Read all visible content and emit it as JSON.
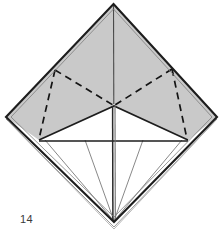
{
  "figure": {
    "step_number": "14",
    "caption_partial": "",
    "background_color": "#ffffff"
  },
  "colors": {
    "paper_shaded": "#c9c9c9",
    "paper_shaded_dark": "#bdbdbd",
    "paper_white": "#ffffff",
    "outline": "#1d1d1d",
    "crease_thin": "#6a6a6a",
    "fold_dashed": "#141414",
    "label_text": "#3a3a3a",
    "edge_layer": "#8a8a8a"
  },
  "geometry": {
    "top_apex": {
      "x": 113.5,
      "y": 4
    },
    "left_vertex": {
      "x": 6,
      "y": 117
    },
    "right_vertex": {
      "x": 217,
      "y": 117
    },
    "bottom_apex": {
      "x": 114,
      "y": 222
    },
    "center_point": {
      "x": 114,
      "y": 106
    },
    "white_left_corner": {
      "x": 39,
      "y": 140
    },
    "white_right_corner": {
      "x": 188,
      "y": 140
    },
    "dash_left_top": {
      "x": 55,
      "y": 70
    },
    "dash_right_top": {
      "x": 172,
      "y": 69
    }
  },
  "elements": {
    "outer_diamond_label": "outer paper diamond outline",
    "shaded_region_label": "shaded upper paper surface",
    "white_region_label": "white lower paper surface",
    "center_spine_label": "vertical center crease",
    "dashed_left_label": "left dashed valley fold triangle",
    "dashed_right_label": "right dashed valley fold triangle",
    "fan_creases_label": "fan of thin crease lines to bottom point",
    "step_label": "figure step number"
  }
}
